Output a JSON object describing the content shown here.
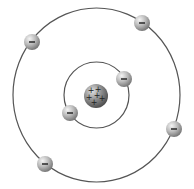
{
  "diagram": {
    "type": "atom-model",
    "background": "#ffffff",
    "orbit_color": "#555555",
    "nucleus": {
      "cx": 96,
      "cy": 96,
      "r": 12,
      "charge_symbols": [
        "+",
        "+",
        "+",
        "+",
        "+",
        "+"
      ],
      "color": "#8a8a8a"
    },
    "orbits": [
      {
        "name": "inner",
        "cx": 96.5,
        "cy": 95,
        "rx": 32.5,
        "ry": 33
      },
      {
        "name": "outer",
        "cx": 96.5,
        "cy": 95,
        "rx": 83.5,
        "ry": 87
      }
    ],
    "electrons": [
      {
        "orbit": "inner",
        "cx": 124,
        "cy": 79,
        "symbol": "−"
      },
      {
        "orbit": "inner",
        "cx": 70,
        "cy": 113,
        "symbol": "−"
      },
      {
        "orbit": "outer",
        "cx": 32,
        "cy": 42,
        "symbol": "−"
      },
      {
        "orbit": "outer",
        "cx": 142,
        "cy": 23,
        "symbol": "−"
      },
      {
        "orbit": "outer",
        "cx": 174,
        "cy": 129,
        "symbol": "−"
      },
      {
        "orbit": "outer",
        "cx": 45,
        "cy": 164,
        "symbol": "−"
      }
    ],
    "electron_radius": 8,
    "electron_color": "#b5b5b5"
  }
}
